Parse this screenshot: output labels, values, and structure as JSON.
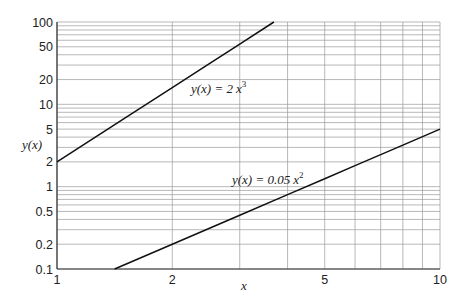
{
  "chart_data": {
    "type": "line",
    "title": "",
    "xlabel": "x",
    "ylabel": "y(x)",
    "xscale": "log",
    "yscale": "log",
    "xlim": [
      1,
      10
    ],
    "ylim": [
      0.1,
      100
    ],
    "grid": true,
    "legend": "none (inline curve labels)",
    "x_ticks": [
      1,
      2,
      5,
      10
    ],
    "x_tick_labels": [
      "1",
      "2",
      "5",
      "10"
    ],
    "y_ticks": [
      0.1,
      0.2,
      0.5,
      1,
      2,
      5,
      10,
      20,
      50,
      100
    ],
    "y_tick_labels": [
      "0.1",
      "0.2",
      "0.5",
      "1",
      "2",
      "5",
      "10",
      "20",
      "50",
      "100"
    ],
    "series": [
      {
        "name": "y(x) = 2x^3",
        "label_text": "y(x) = 2 x³",
        "formula": "2*x^3",
        "x": [
          1,
          1.5,
          2,
          2.5,
          3,
          3.684
        ],
        "y": [
          2,
          6.75,
          16,
          31.25,
          54,
          100
        ]
      },
      {
        "name": "y(x) = 0.05x^2",
        "label_text": "y(x) = 0.05 x²",
        "formula": "0.05*x^2",
        "x": [
          1.414,
          2,
          3,
          4,
          5,
          6,
          8,
          10
        ],
        "y": [
          0.1,
          0.2,
          0.45,
          0.8,
          1.25,
          1.8,
          3.2,
          5
        ]
      }
    ],
    "annotations": [
      {
        "text": "y(x) = 2 x³",
        "near": {
          "x": 2.1,
          "y": 15
        }
      },
      {
        "text": "y(x) = 0.05 x²",
        "near": {
          "x": 3.0,
          "y": 1.1
        }
      }
    ]
  },
  "labels": {
    "xlabel": "x",
    "ylabel": "y(x)",
    "eq1_prefix": "y(x) = 2",
    "eq1_var": "x",
    "eq1_exp": "3",
    "eq2_prefix": "y(x) = 0.05",
    "eq2_var": "x",
    "eq2_exp": "2"
  },
  "style": {
    "line_color": "#111111",
    "grid_color": "#9a9a9a",
    "axis_color": "#333333"
  }
}
